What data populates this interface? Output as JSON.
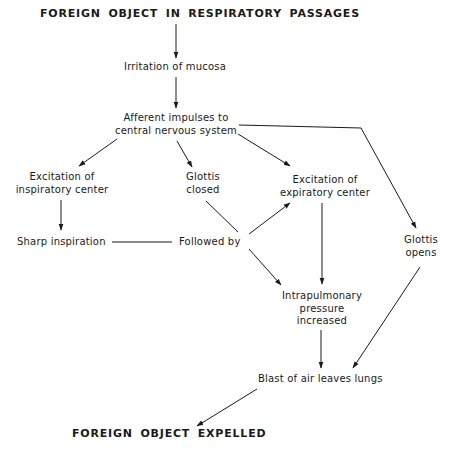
{
  "diagram": {
    "type": "flowchart",
    "nodes": {
      "start": {
        "text": "FOREIGN OBJECT IN RESPIRATORY PASSAGES"
      },
      "irritation": {
        "text": "Irritation of mucosa"
      },
      "afferent": {
        "line1": "Afferent impulses to",
        "line2": "central nervous system"
      },
      "insp_center": {
        "line1": "Excitation of",
        "line2": "inspiratory center"
      },
      "glottis_closed": {
        "line1": "Glottis",
        "line2": "closed"
      },
      "exp_center": {
        "line1": "Excitation of",
        "line2": "expiratory center"
      },
      "glottis_opens": {
        "line1": "Glottis",
        "line2": "opens"
      },
      "sharp_insp": {
        "text": "Sharp inspiration"
      },
      "followed_by": {
        "text": "Followed by"
      },
      "intrapulmonary": {
        "line1": "Intrapulmonary",
        "line2": "pressure",
        "line3": "increased"
      },
      "blast": {
        "text": "Blast of air leaves lungs"
      },
      "end": {
        "text": "FOREIGN OBJECT EXPELLED"
      }
    },
    "edges": [
      {
        "from": "start",
        "to": "irritation",
        "arrow": true
      },
      {
        "from": "irritation",
        "to": "afferent",
        "arrow": true
      },
      {
        "from": "afferent",
        "to": "insp_center",
        "arrow": true
      },
      {
        "from": "afferent",
        "to": "glottis_closed",
        "arrow": true
      },
      {
        "from": "afferent",
        "to": "exp_center",
        "arrow": true
      },
      {
        "from": "afferent",
        "to": "glottis_opens",
        "arrow": true
      },
      {
        "from": "insp_center",
        "to": "sharp_insp",
        "arrow": true
      },
      {
        "from": "sharp_insp",
        "to": "followed_by",
        "arrow": false
      },
      {
        "from": "glottis_closed",
        "to": "followed_by",
        "arrow": false
      },
      {
        "from": "followed_by",
        "to": "exp_center",
        "arrow": true
      },
      {
        "from": "followed_by",
        "to": "intrapulmonary",
        "arrow": true
      },
      {
        "from": "exp_center",
        "to": "intrapulmonary",
        "arrow": true
      },
      {
        "from": "intrapulmonary",
        "to": "blast",
        "arrow": true
      },
      {
        "from": "glottis_opens",
        "to": "blast",
        "arrow": true
      },
      {
        "from": "blast",
        "to": "end",
        "arrow": true
      }
    ],
    "colors": {
      "ink": "#1a1a1a",
      "background": "#ffffff"
    }
  }
}
